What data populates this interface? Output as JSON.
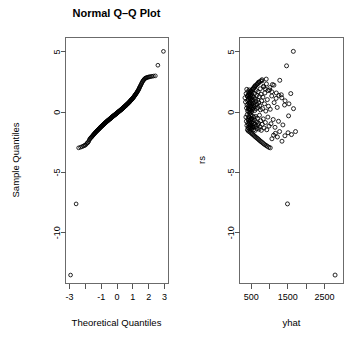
{
  "figure": {
    "title": "Normal Q–Q Plot",
    "background": "#ffffff",
    "foreground": "#000000",
    "point_symbol": "open-circle"
  },
  "chart_data": [
    {
      "type": "scatter",
      "id": "normal-qq-plot",
      "title": "Normal Q–Q Plot",
      "xlabel": "Theoretical Quantiles",
      "ylabel": "Sample Quantiles",
      "xlim": [
        -3.25,
        3.25
      ],
      "ylim": [
        -14.2,
        6.2
      ],
      "grid": false,
      "legend": null,
      "xticks": [
        -3,
        -2,
        -1,
        0,
        1,
        2,
        3
      ],
      "xticklabels": [
        "-3",
        "",
        "-1",
        "0",
        "1",
        "2",
        "3"
      ],
      "yticks": [
        5,
        0,
        -5,
        -10
      ],
      "yticklabels": [
        "5",
        "0",
        "-5",
        "-10"
      ],
      "x": [
        -2.93,
        -2.58,
        -2.42,
        -2.3,
        -2.2,
        -2.12,
        -2.05,
        -1.99,
        -1.93,
        -1.88,
        -1.83,
        -1.79,
        -1.75,
        -1.71,
        -1.67,
        -1.64,
        -1.6,
        -1.57,
        -1.54,
        -1.51,
        -1.48,
        -1.45,
        -1.43,
        -1.4,
        -1.38,
        -1.35,
        -1.33,
        -1.3,
        -1.28,
        -1.26,
        -1.24,
        -1.21,
        -1.19,
        -1.17,
        -1.15,
        -1.13,
        -1.11,
        -1.09,
        -1.07,
        -1.06,
        -1.04,
        -1.02,
        -1.0,
        -0.98,
        -0.97,
        -0.95,
        -0.93,
        -0.91,
        -0.9,
        -0.88,
        -0.86,
        -0.85,
        -0.83,
        -0.82,
        -0.8,
        -0.79,
        -0.77,
        -0.76,
        -0.74,
        -0.73,
        -0.71,
        -0.7,
        -0.68,
        -0.67,
        -0.65,
        -0.64,
        -0.62,
        -0.61,
        -0.6,
        -0.58,
        -0.57,
        -0.56,
        -0.54,
        -0.53,
        -0.52,
        -0.5,
        -0.49,
        -0.48,
        -0.46,
        -0.45,
        -0.44,
        -0.42,
        -0.41,
        -0.4,
        -0.39,
        -0.37,
        -0.36,
        -0.35,
        -0.34,
        -0.32,
        -0.31,
        -0.3,
        -0.29,
        -0.27,
        -0.26,
        -0.25,
        -0.24,
        -0.23,
        -0.21,
        -0.2,
        -0.19,
        -0.18,
        -0.16,
        -0.15,
        -0.14,
        -0.13,
        -0.12,
        -0.1,
        -0.09,
        -0.08,
        -0.07,
        -0.06,
        -0.04,
        -0.03,
        -0.02,
        -0.01,
        0.01,
        0.02,
        0.03,
        0.04,
        0.06,
        0.07,
        0.08,
        0.09,
        0.1,
        0.12,
        0.13,
        0.14,
        0.15,
        0.16,
        0.18,
        0.19,
        0.2,
        0.21,
        0.23,
        0.24,
        0.25,
        0.26,
        0.27,
        0.29,
        0.3,
        0.31,
        0.32,
        0.34,
        0.35,
        0.36,
        0.37,
        0.39,
        0.4,
        0.41,
        0.42,
        0.44,
        0.45,
        0.46,
        0.48,
        0.49,
        0.5,
        0.52,
        0.53,
        0.54,
        0.56,
        0.57,
        0.58,
        0.6,
        0.61,
        0.62,
        0.64,
        0.65,
        0.67,
        0.68,
        0.7,
        0.71,
        0.73,
        0.74,
        0.76,
        0.77,
        0.79,
        0.8,
        0.82,
        0.83,
        0.85,
        0.86,
        0.88,
        0.9,
        0.91,
        0.93,
        0.95,
        0.97,
        0.98,
        1.0,
        1.02,
        1.04,
        1.06,
        1.07,
        1.09,
        1.11,
        1.13,
        1.15,
        1.17,
        1.19,
        1.21,
        1.24,
        1.26,
        1.28,
        1.3,
        1.33,
        1.35,
        1.38,
        1.4,
        1.43,
        1.45,
        1.48,
        1.51,
        1.54,
        1.57,
        1.6,
        1.64,
        1.67,
        1.71,
        1.75,
        1.79,
        1.83,
        1.88,
        1.93,
        1.99,
        2.05,
        2.12,
        2.2,
        2.3,
        2.42,
        2.58,
        2.93
      ],
      "y": [
        -13.5,
        -7.6,
        -2.95,
        -2.9,
        -2.85,
        -2.8,
        -2.75,
        -2.72,
        -2.62,
        -2.55,
        -2.5,
        -2.42,
        -2.3,
        -2.2,
        -2.15,
        -2.1,
        -2.05,
        -2.0,
        -1.95,
        -1.9,
        -1.86,
        -1.82,
        -1.78,
        -1.74,
        -1.7,
        -1.67,
        -1.63,
        -1.6,
        -1.57,
        -1.54,
        -1.51,
        -1.48,
        -1.45,
        -1.42,
        -1.4,
        -1.37,
        -1.34,
        -1.32,
        -1.29,
        -1.27,
        -1.24,
        -1.22,
        -1.2,
        -1.18,
        -1.15,
        -1.13,
        -1.11,
        -1.09,
        -1.07,
        -1.05,
        -1.03,
        -1.01,
        -0.99,
        -0.97,
        -0.95,
        -0.93,
        -0.91,
        -0.9,
        -0.88,
        -0.86,
        -0.84,
        -0.83,
        -0.81,
        -0.79,
        -0.78,
        -0.76,
        -0.74,
        -0.73,
        -0.71,
        -0.7,
        -0.68,
        -0.67,
        -0.65,
        -0.64,
        -0.62,
        -0.61,
        -0.59,
        -0.58,
        -0.56,
        -0.55,
        -0.53,
        -0.52,
        -0.51,
        -0.49,
        -0.48,
        -0.46,
        -0.45,
        -0.44,
        -0.42,
        -0.41,
        -0.4,
        -0.38,
        -0.37,
        -0.36,
        -0.34,
        -0.33,
        -0.32,
        -0.3,
        -0.29,
        -0.28,
        -0.27,
        -0.25,
        -0.24,
        -0.23,
        -0.21,
        -0.2,
        -0.19,
        -0.18,
        -0.16,
        -0.15,
        -0.14,
        -0.12,
        -0.11,
        -0.1,
        -0.09,
        -0.07,
        -0.06,
        -0.05,
        -0.03,
        -0.02,
        -0.01,
        0.01,
        0.02,
        0.03,
        0.05,
        0.06,
        0.07,
        0.09,
        0.1,
        0.11,
        0.13,
        0.14,
        0.15,
        0.17,
        0.18,
        0.19,
        0.21,
        0.22,
        0.23,
        0.25,
        0.26,
        0.28,
        0.29,
        0.3,
        0.32,
        0.33,
        0.35,
        0.36,
        0.38,
        0.39,
        0.41,
        0.42,
        0.44,
        0.45,
        0.47,
        0.48,
        0.5,
        0.51,
        0.53,
        0.55,
        0.56,
        0.58,
        0.6,
        0.61,
        0.63,
        0.65,
        0.67,
        0.68,
        0.7,
        0.72,
        0.74,
        0.76,
        0.78,
        0.8,
        0.82,
        0.84,
        0.86,
        0.88,
        0.9,
        0.93,
        0.95,
        0.97,
        1.0,
        1.02,
        1.05,
        1.07,
        1.1,
        1.12,
        1.15,
        1.18,
        1.21,
        1.24,
        1.27,
        1.3,
        1.33,
        1.37,
        1.4,
        1.44,
        1.48,
        1.52,
        1.56,
        1.6,
        1.65,
        1.7,
        1.75,
        1.8,
        1.86,
        1.92,
        1.99,
        2.06,
        2.13,
        2.2,
        2.28,
        2.36,
        2.44,
        2.52,
        2.6,
        2.66,
        2.72,
        2.78,
        2.82,
        2.85,
        2.88,
        2.9,
        2.92,
        2.94,
        2.96,
        2.98,
        3.0,
        3.02,
        3.9,
        5.05
      ]
    },
    {
      "type": "scatter",
      "id": "residuals-vs-fitted-plot",
      "title": "",
      "xlabel": "yhat",
      "ylabel": "rs",
      "xlim": [
        180,
        3020
      ],
      "ylim": [
        -14.2,
        6.2
      ],
      "grid": false,
      "legend": null,
      "xticks": [
        500,
        1000,
        1500,
        2000,
        2500
      ],
      "xticklabels": [
        "500",
        "",
        "1500",
        "",
        "2500"
      ],
      "yticks": [
        5,
        0,
        -5,
        -10
      ],
      "yticklabels": [
        "5",
        "0",
        "-5",
        "-10"
      ],
      "x": [
        330,
        345,
        355,
        360,
        368,
        372,
        378,
        382,
        385,
        390,
        393,
        396,
        400,
        403,
        406,
        409,
        412,
        415,
        417,
        420,
        422,
        425,
        427,
        430,
        432,
        434,
        436,
        438,
        440,
        442,
        444,
        446,
        448,
        450,
        452,
        454,
        456,
        458,
        460,
        462,
        464,
        466,
        468,
        470,
        472,
        474,
        476,
        478,
        480,
        482,
        484,
        486,
        488,
        490,
        492,
        494,
        496,
        498,
        500,
        502,
        505,
        508,
        510,
        513,
        516,
        519,
        522,
        525,
        528,
        531,
        534,
        537,
        540,
        543,
        546,
        549,
        552,
        555,
        558,
        561,
        564,
        567,
        570,
        573,
        576,
        580,
        584,
        588,
        592,
        596,
        600,
        604,
        608,
        612,
        616,
        620,
        625,
        630,
        635,
        640,
        645,
        650,
        655,
        660,
        665,
        670,
        675,
        680,
        685,
        690,
        696,
        702,
        708,
        714,
        720,
        726,
        732,
        738,
        745,
        752,
        760,
        768,
        776,
        784,
        792,
        800,
        810,
        820,
        830,
        840,
        850,
        862,
        874,
        886,
        898,
        910,
        925,
        940,
        955,
        970,
        985,
        1000,
        1020,
        1040,
        1060,
        1080,
        1100,
        1125,
        1150,
        1180,
        1210,
        1245,
        1280,
        1320,
        1365,
        1410,
        1465,
        1520,
        1580,
        1650,
        420,
        455,
        490,
        520,
        545,
        575,
        600,
        630,
        660,
        690,
        715,
        745,
        775,
        805,
        835,
        870,
        905,
        940,
        980,
        1020,
        1065,
        1110,
        1160,
        1215,
        1275,
        1340,
        1420,
        1505,
        1600,
        1710,
        400,
        430,
        462,
        495,
        525,
        560,
        590,
        625,
        655,
        690,
        725,
        760,
        795,
        835,
        875,
        915,
        960,
        1010,
        1060,
        1120,
        1185,
        1255,
        1335,
        1425,
        1530,
        1655,
        1490,
        2790
      ],
      "y": [
        1.2,
        0.85,
        -0.4,
        1.55,
        -0.75,
        0.35,
        1.9,
        -1.1,
        0.6,
        -0.2,
        1.35,
        -1.45,
        0.95,
        0.1,
        -0.9,
        1.7,
        -0.55,
        0.45,
        -1.25,
        1.05,
        0.25,
        -0.65,
        1.45,
        -1.0,
        0.75,
        -0.35,
        1.15,
        0.05,
        -1.35,
        0.55,
        1.85,
        -0.8,
        0.3,
        -1.15,
        1.25,
        -0.45,
        0.9,
        -0.1,
        1.6,
        -1.5,
        0.65,
        0.15,
        -0.95,
        1.4,
        -0.6,
        0.8,
        -1.2,
        1.1,
        0.2,
        -0.7,
        1.75,
        -1.05,
        0.5,
        -0.25,
        1.3,
        0.0,
        -1.4,
        0.95,
        -0.5,
        1.5,
        0.4,
        -0.85,
        1.2,
        -1.3,
        0.7,
        0.1,
        -0.6,
        1.65,
        -1.1,
        0.85,
        -0.3,
        1.35,
        0.25,
        -1.2,
        1.0,
        -0.75,
        0.55,
        1.9,
        -0.95,
        0.35,
        -1.45,
        1.25,
        -0.4,
        0.75,
        2.05,
        -1.25,
        0.45,
        -0.65,
        1.55,
        0.15,
        -1.0,
        2.2,
        0.6,
        -1.5,
        1.1,
        -0.35,
        0.9,
        -1.15,
        1.8,
        0.3,
        -0.8,
        1.4,
        -1.35,
        0.65,
        2.35,
        -0.5,
        1.0,
        -1.05,
        0.4,
        1.7,
        -0.9,
        2.5,
        0.8,
        -1.4,
        1.3,
        -0.25,
        0.55,
        -1.2,
        1.95,
        0.2,
        -0.7,
        1.5,
        -1.5,
        0.95,
        2.6,
        -1.0,
        0.3,
        1.25,
        -0.55,
        2.1,
        -1.3,
        0.7,
        1.6,
        -0.85,
        0.1,
        2.75,
        -1.45,
        1.05,
        -0.4,
        0.5,
        -1.15,
        1.85,
        0.25,
        -0.95,
        1.35,
        2.3,
        -0.6,
        0.8,
        -1.25,
        1.15,
        0.4,
        -0.75,
        2.65,
        1.45,
        -1.05,
        0.6,
        3.85,
        -0.3,
        1.55,
        5.05,
        -1.55,
        -1.62,
        -1.7,
        -1.78,
        -1.85,
        -1.92,
        -2.0,
        -2.08,
        -2.15,
        -2.22,
        -2.3,
        -2.38,
        -2.45,
        -2.52,
        -2.6,
        -2.68,
        -2.75,
        -2.82,
        -2.9,
        -2.95,
        -2.2,
        -1.9,
        -1.75,
        -2.05,
        -1.6,
        -2.4,
        -1.95,
        -1.7,
        -1.85,
        -1.6,
        1.3,
        1.45,
        1.6,
        1.75,
        1.9,
        2.0,
        2.1,
        2.2,
        2.3,
        2.4,
        2.5,
        2.6,
        2.7,
        2.15,
        1.95,
        2.35,
        1.8,
        2.05,
        1.7,
        2.25,
        1.6,
        1.4,
        1.2,
        0.95,
        0.7,
        0.3,
        -7.6,
        -13.5
      ]
    }
  ],
  "panels": {
    "left": {
      "title": "Normal Q–Q Plot",
      "xlabel": "Theoretical Quantiles",
      "ylabel": "Sample Quantiles"
    },
    "right": {
      "title": "",
      "xlabel": "yhat",
      "ylabel": "rs"
    }
  }
}
